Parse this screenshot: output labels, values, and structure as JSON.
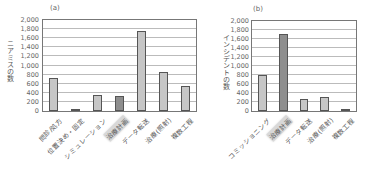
{
  "chart_data": [
    {
      "type": "bar",
      "title": "(a)",
      "xlabel": "",
      "ylabel": "ニアミスの数",
      "ylim": [
        0,
        2000
      ],
      "yticks": [
        "0",
        "200",
        "400",
        "600",
        "800",
        "1,000",
        "1,200",
        "1,400",
        "1,600",
        "1,800",
        "2,000"
      ],
      "grid": true,
      "categories": [
        "問診/処方",
        "位置決め・固定",
        "シミュレーション",
        "治療計画",
        "データ転送",
        "治療(照射)",
        "複数工程"
      ],
      "values": [
        730,
        30,
        350,
        340,
        1760,
        850,
        540
      ],
      "highlighted_category": "治療計画"
    },
    {
      "type": "bar",
      "title": "(b)",
      "xlabel": "",
      "ylabel": "インシデントの数",
      "ylim": [
        0,
        2000
      ],
      "yticks": [
        "0",
        "200",
        "400",
        "600",
        "800",
        "1,000",
        "1,200",
        "1,400",
        "1,600",
        "1,800",
        "2,000"
      ],
      "grid": true,
      "categories": [
        "コミッショニング",
        "治療計画",
        "データ転送",
        "治療(照射)",
        "複数工程"
      ],
      "values": [
        800,
        1710,
        270,
        310,
        10
      ],
      "highlighted_category": "治療計画"
    }
  ],
  "colors": {
    "bar": "#c6c6c6",
    "bar_highlight": "#8e8e8e",
    "grid": "#bbbbbb",
    "frame": "#777777"
  }
}
